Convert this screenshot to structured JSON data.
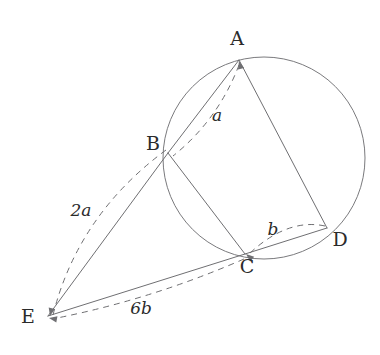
{
  "figure": {
    "background_color": "#ffffff",
    "stroke_color": "#6f6f72",
    "label_color": "#2b2b2b",
    "canvas": {
      "width": 380,
      "height": 355
    }
  },
  "circle": {
    "name": "circumscribed-circle",
    "cx": 264,
    "cy": 158,
    "r": 101
  },
  "points": [
    {
      "id": "A",
      "label": "A",
      "x": 239,
      "y": 60,
      "label_x": 237,
      "label_y": 45,
      "on_circle": true
    },
    {
      "id": "B",
      "label": "B",
      "x": 168,
      "y": 153,
      "label_x": 153,
      "label_y": 150,
      "on_circle": true
    },
    {
      "id": "C",
      "label": "C",
      "x": 245,
      "y": 254,
      "label_x": 247,
      "label_y": 273,
      "on_circle": true
    },
    {
      "id": "D",
      "label": "D",
      "x": 327,
      "y": 228,
      "label_x": 340,
      "label_y": 246,
      "on_circle": true
    },
    {
      "id": "E",
      "label": "E",
      "x": 48,
      "y": 316,
      "label_x": 28,
      "label_y": 323,
      "on_circle": false
    }
  ],
  "solid_segments": [
    {
      "name": "segment-A-B",
      "from": "A",
      "to": "B",
      "x1": 239,
      "y1": 60,
      "x2": 168,
      "y2": 153
    },
    {
      "name": "segment-A-D",
      "from": "A",
      "to": "D",
      "x1": 239,
      "y1": 60,
      "x2": 327,
      "y2": 228
    },
    {
      "name": "segment-B-C",
      "from": "B",
      "to": "C",
      "x1": 168,
      "y1": 153,
      "x2": 245,
      "y2": 254
    },
    {
      "name": "segment-C-D",
      "from": "C",
      "to": "D",
      "x1": 245,
      "y1": 254,
      "x2": 327,
      "y2": 228
    },
    {
      "name": "segment-E-B",
      "from": "E",
      "to": "B",
      "x1": 48,
      "y1": 316,
      "x2": 168,
      "y2": 153
    },
    {
      "name": "segment-E-C",
      "from": "E",
      "to": "C",
      "x1": 48,
      "y1": 316,
      "x2": 245,
      "y2": 254
    }
  ],
  "dashed_measures": [
    {
      "name": "measure-arc-a",
      "label": "a",
      "from": "A",
      "to": "B",
      "path": "M 239 65 Q 218 120 173 156",
      "arrow_at": "A",
      "arrow_x": 239,
      "arrow_y": 61,
      "arrow_angle": -105,
      "label_x": 217,
      "label_y": 121
    },
    {
      "name": "measure-arc-2a",
      "label": "2a",
      "from": "B",
      "to": "E",
      "path": "M 166 150 Q 78 215 53 315",
      "arrow_at": "E",
      "arrow_x": 50,
      "arrow_y": 316,
      "arrow_angle": 103,
      "label_x": 81,
      "label_y": 216
    },
    {
      "name": "measure-arc-b",
      "label": "b",
      "from": "C",
      "to": "D",
      "path": "M 250 253 Q 288 218 325 226",
      "arrow_at": "C",
      "arrow_x": 246,
      "arrow_y": 254,
      "arrow_angle": 220,
      "label_x": 273,
      "label_y": 235
    },
    {
      "name": "measure-arc-6b",
      "label": "6b",
      "from": "C",
      "to": "E",
      "path": "M 244 259 Q 150 300 52 319",
      "arrow_at": "E",
      "arrow_x": 49,
      "arrow_y": 318,
      "arrow_angle": 190,
      "label_x": 141,
      "label_y": 314
    }
  ]
}
